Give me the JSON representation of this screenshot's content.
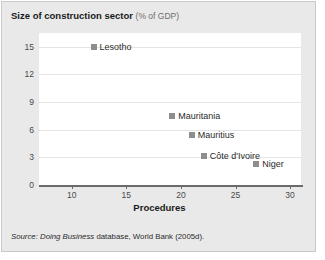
{
  "figure": {
    "title_main": "Size of construction sector",
    "title_sub": "(% of GDP)",
    "source_prefix": "Source:",
    "source_italic": "Doing Business",
    "source_rest": "database, World Bank (2005d)."
  },
  "chart_data": {
    "type": "scatter",
    "title": "Size of construction sector (% of GDP)",
    "xlabel": "Procedures",
    "ylabel": "",
    "xlim": [
      7,
      31
    ],
    "ylim": [
      0,
      16.5
    ],
    "xticks": [
      10,
      15,
      20,
      25,
      30
    ],
    "yticks": [
      0,
      3,
      6,
      9,
      12,
      15
    ],
    "grid": "horizontal",
    "legend": "none",
    "marker_color": "#8e8e8e",
    "points": [
      {
        "label": "Lesotho",
        "x": 12.0,
        "y": 15.0
      },
      {
        "label": "Mauritania",
        "x": 19.2,
        "y": 7.5
      },
      {
        "label": "Mauritius",
        "x": 21.0,
        "y": 5.4
      },
      {
        "label": "Côte d'Ivoire",
        "x": 22.1,
        "y": 3.2
      },
      {
        "label": "Niger",
        "x": 26.9,
        "y": 2.3
      }
    ]
  }
}
